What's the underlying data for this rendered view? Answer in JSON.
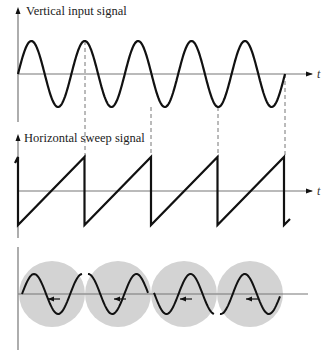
{
  "panels": {
    "vertical": {
      "label": "Vertical input signal",
      "axis_label": "t",
      "waveform": "sine",
      "cycles": 5
    },
    "horizontal": {
      "label": "Horizontal sweep signal",
      "axis_label": "t",
      "waveform": "sawtooth",
      "cycles": 4
    },
    "display": {
      "waveform": "sine-segments-on-screen",
      "screens": 4,
      "retrace_arrow": "left"
    }
  },
  "colors": {
    "trace": "#111111",
    "axis": "#777777",
    "dashed": "#777777",
    "screen_fill": "#d3d3d3"
  },
  "geometry": {
    "x0": 18,
    "x_end": 285,
    "sine": {
      "mid": 74,
      "amp": 33,
      "period": 53.4
    },
    "saw": {
      "mid": 191,
      "top": 157,
      "bottom": 225,
      "period": 66.5
    },
    "screen": {
      "mid": 294,
      "radius": 33,
      "amp": 20,
      "centers": [
        52,
        118,
        184,
        250
      ]
    },
    "dashed_x": [
      85,
      151,
      218,
      285
    ]
  }
}
